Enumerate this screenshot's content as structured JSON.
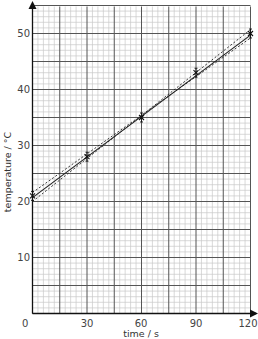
{
  "chart_data": {
    "type": "scatter",
    "title": "",
    "xlabel": "time / s",
    "ylabel": "temperature / °C",
    "xlim": [
      0,
      120
    ],
    "ylim": [
      0,
      55
    ],
    "x_ticks": [
      0,
      30,
      60,
      90,
      120
    ],
    "y_ticks": [
      10,
      20,
      30,
      40,
      50
    ],
    "origin_label": "0",
    "grid": true,
    "grid_major_x": 15,
    "grid_major_y": 5,
    "grid_minor_x": 3,
    "grid_minor_y": 1,
    "legend": null,
    "series": [
      {
        "name": "measurements",
        "kind": "points-with-error-bars",
        "marker": "cross",
        "x": [
          0,
          30,
          60,
          90,
          120
        ],
        "y": [
          21,
          28,
          35,
          43,
          50
        ],
        "y_error": [
          0.8,
          0.8,
          0.8,
          0.8,
          0.8
        ]
      },
      {
        "name": "best fit line",
        "kind": "line",
        "style": "solid",
        "x": [
          0,
          120
        ],
        "y": [
          20.7,
          49.7
        ]
      },
      {
        "name": "max gradient line",
        "kind": "line",
        "style": "dashed",
        "x": [
          0,
          120
        ],
        "y": [
          20.0,
          50.7
        ]
      },
      {
        "name": "min gradient line",
        "kind": "line",
        "style": "dashed",
        "x": [
          0,
          120
        ],
        "y": [
          21.6,
          49.2
        ]
      }
    ]
  },
  "labels": {
    "xlabel": "time / s",
    "ylabel": "temperature / °C",
    "origin": "0",
    "x_ticks": [
      "30",
      "60",
      "90",
      "120"
    ],
    "y_ticks": [
      "10",
      "20",
      "30",
      "40",
      "50"
    ]
  },
  "colors": {
    "minor_grid": "#c8c8c8",
    "major_grid": "#555555",
    "axis": "#111111",
    "line": "#222222"
  }
}
